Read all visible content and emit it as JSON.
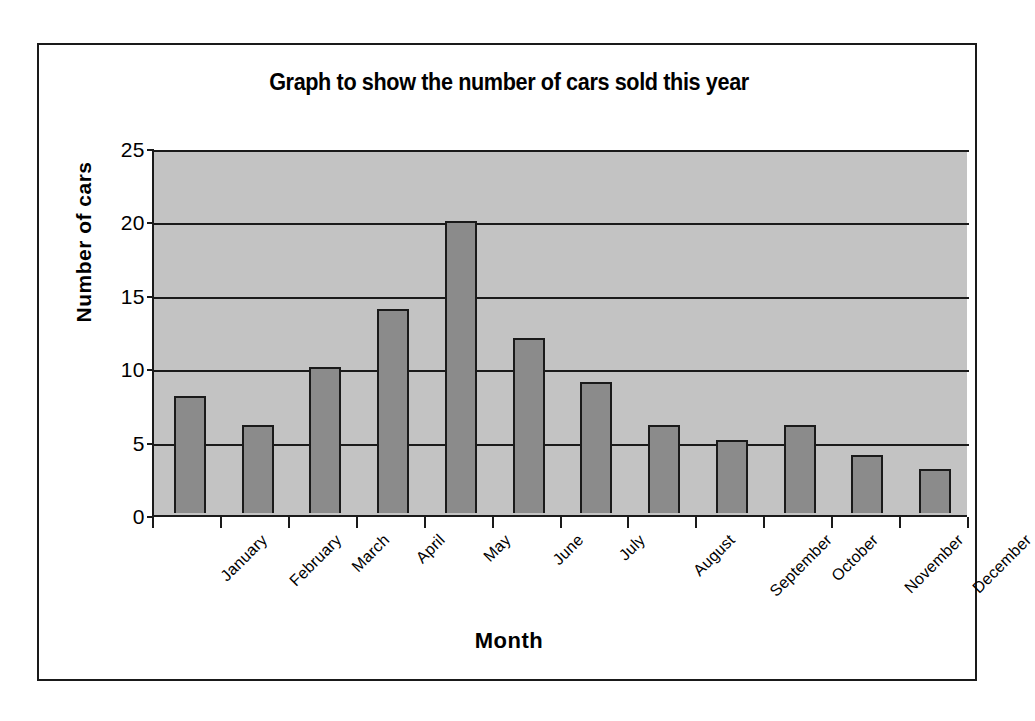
{
  "chart_data": {
    "type": "bar",
    "title": "Graph to show the number of cars sold this year",
    "xlabel": "Month",
    "ylabel": "Number of cars",
    "categories": [
      "January",
      "February",
      "March",
      "April",
      "May",
      "June",
      "July",
      "August",
      "September",
      "October",
      "November",
      "December"
    ],
    "values": [
      8,
      6,
      10,
      14,
      20,
      12,
      9,
      6,
      5,
      6,
      4,
      3
    ],
    "ylim": [
      0,
      25
    ],
    "ytick_values": [
      0,
      5,
      10,
      15,
      20,
      25
    ],
    "ytick_labels": [
      "0",
      "5",
      "10",
      "15",
      "20",
      "25"
    ],
    "grid": true,
    "legend": "none",
    "series": [
      {
        "name": "Number of cars",
        "values": [
          8,
          6,
          10,
          14,
          20,
          12,
          9,
          6,
          5,
          6,
          4,
          3
        ]
      }
    ]
  },
  "style": {
    "plot_background": "#c3c3c3",
    "bar_fill": "#8b8b8b",
    "bar_border": "#1a1a1a",
    "gridline_color": "#1a1a1a",
    "axis_color": "#1a1a1a",
    "page_background": "#ffffff",
    "text_color": "#000000"
  }
}
